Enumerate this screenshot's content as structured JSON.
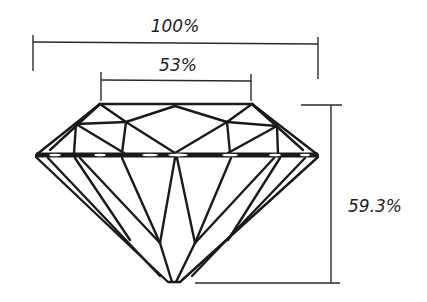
{
  "diagram": {
    "dimensions": [
      {
        "id": "total-width",
        "label": "100%",
        "meaning": "girdle diameter"
      },
      {
        "id": "table-width",
        "label": "53%",
        "meaning": "table width"
      },
      {
        "id": "total-depth",
        "label": "59.3%",
        "meaning": "total depth"
      }
    ],
    "colors": {
      "line": "#1a1a1a",
      "background": "#ffffff"
    }
  }
}
